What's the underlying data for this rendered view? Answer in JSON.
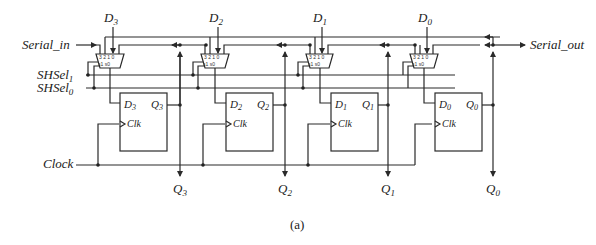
{
  "diagram": {
    "type": "4-bit universal shift register (circuit schematic)",
    "caption": "(a)",
    "inputs": {
      "serial_in": "Serial_in",
      "shsel1": {
        "base": "SHSel",
        "sub": "1"
      },
      "shsel0": {
        "base": "SHSel",
        "sub": "0"
      },
      "clock": "Clock"
    },
    "outputs": {
      "serial_out": "Serial_out"
    },
    "stages": [
      {
        "id": 3,
        "d_input": {
          "base": "D",
          "sub": "3"
        },
        "ff_d": {
          "base": "D",
          "sub": "3"
        },
        "ff_q": {
          "base": "Q",
          "sub": "3"
        },
        "clk": "Clk",
        "q_out": {
          "base": "Q",
          "sub": "3"
        },
        "mux_inputs": [
          "3",
          "2",
          "1",
          "0"
        ],
        "mux_sel": [
          "s1",
          "s0"
        ]
      },
      {
        "id": 2,
        "d_input": {
          "base": "D",
          "sub": "2"
        },
        "ff_d": {
          "base": "D",
          "sub": "2"
        },
        "ff_q": {
          "base": "Q",
          "sub": "2"
        },
        "clk": "Clk",
        "q_out": {
          "base": "Q",
          "sub": "2"
        },
        "mux_inputs": [
          "3",
          "2",
          "1",
          "0"
        ],
        "mux_sel": [
          "s1",
          "s0"
        ]
      },
      {
        "id": 1,
        "d_input": {
          "base": "D",
          "sub": "1"
        },
        "ff_d": {
          "base": "D",
          "sub": "1"
        },
        "ff_q": {
          "base": "Q",
          "sub": "1"
        },
        "clk": "Clk",
        "q_out": {
          "base": "Q",
          "sub": "1"
        },
        "mux_inputs": [
          "3",
          "2",
          "1",
          "0"
        ],
        "mux_sel": [
          "s1",
          "s0"
        ]
      },
      {
        "id": 0,
        "d_input": {
          "base": "D",
          "sub": "0"
        },
        "ff_d": {
          "base": "D",
          "sub": "0"
        },
        "ff_q": {
          "base": "Q",
          "sub": "0"
        },
        "clk": "Clk",
        "q_out": {
          "base": "Q",
          "sub": "0"
        },
        "mux_inputs": [
          "3",
          "2",
          "1",
          "0"
        ],
        "mux_sel": [
          "s1",
          "s0"
        ]
      }
    ]
  }
}
